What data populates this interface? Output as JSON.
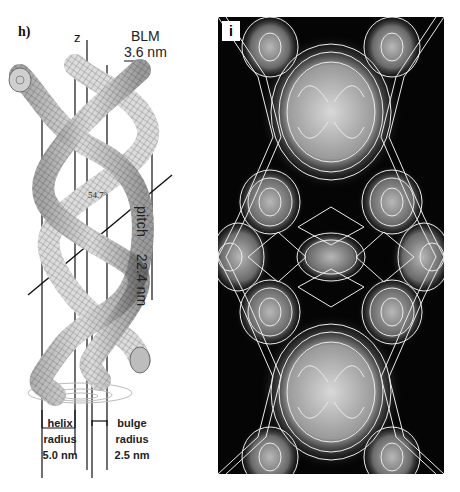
{
  "panel_h": {
    "label": "h)",
    "axis_label": "z",
    "scale_name": "BLM",
    "scale_value": "3.6 nm",
    "angle": "54.7°",
    "pitch_label": "pitch",
    "pitch_value": "22.4 nm",
    "helix_radius": {
      "line1": "helix",
      "line2": "radius",
      "value": "5.0 nm"
    },
    "bulge_radius": {
      "line1": "bulge",
      "line2": "radius",
      "value": "2.5 nm"
    },
    "colors": {
      "tube_fill": "#d8d8d8",
      "tube_grid": "#555555",
      "line": "#111111"
    }
  },
  "panel_i": {
    "label": "i",
    "colors": {
      "background": "#050505",
      "contour": "#e8e8e8",
      "density_high": "#cfcfcf"
    }
  }
}
